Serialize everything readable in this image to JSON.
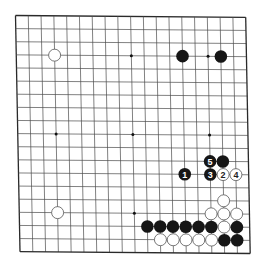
{
  "board": {
    "size": 19,
    "corners": {
      "top_left": [
        15.5,
        15.5
      ],
      "top_right": [
        245.7,
        17.3
      ],
      "bottom_left": [
        20.0,
        251.7
      ]
    },
    "line_color": "#4a4a4a",
    "edge_color": "#2a2a2a",
    "background": "#ffffff",
    "star_points": [
      [
        3,
        3
      ],
      [
        3,
        9
      ],
      [
        3,
        15
      ],
      [
        9,
        3
      ],
      [
        9,
        9
      ],
      [
        9,
        15
      ],
      [
        15,
        3
      ],
      [
        15,
        9
      ],
      [
        15,
        15
      ]
    ]
  },
  "colors": {
    "black_stone": "#161616",
    "white_stone": "#ffffff",
    "white_stone_outline": "#555555",
    "black_label": "#ffffff",
    "white_label": "#222222"
  },
  "stones": [
    {
      "row": 3,
      "col": 3,
      "color": "white",
      "label": ""
    },
    {
      "row": 3,
      "col": 13,
      "color": "black",
      "label": ""
    },
    {
      "row": 3,
      "col": 16,
      "color": "black",
      "label": ""
    },
    {
      "row": 11,
      "col": 15,
      "color": "black",
      "label": "5"
    },
    {
      "row": 11,
      "col": 16,
      "color": "black",
      "label": ""
    },
    {
      "row": 12,
      "col": 13,
      "color": "black",
      "label": "1"
    },
    {
      "row": 12,
      "col": 15,
      "color": "black",
      "label": "3"
    },
    {
      "row": 12,
      "col": 16,
      "color": "white",
      "label": "2"
    },
    {
      "row": 12,
      "col": 17,
      "color": "white",
      "label": "4"
    },
    {
      "row": 14,
      "col": 16,
      "color": "white",
      "label": ""
    },
    {
      "row": 15,
      "col": 3,
      "color": "white",
      "label": ""
    },
    {
      "row": 15,
      "col": 15,
      "color": "white",
      "label": ""
    },
    {
      "row": 15,
      "col": 16,
      "color": "white",
      "label": ""
    },
    {
      "row": 15,
      "col": 17,
      "color": "white",
      "label": ""
    },
    {
      "row": 16,
      "col": 10,
      "color": "black",
      "label": ""
    },
    {
      "row": 16,
      "col": 11,
      "color": "black",
      "label": ""
    },
    {
      "row": 16,
      "col": 12,
      "color": "black",
      "label": ""
    },
    {
      "row": 16,
      "col": 13,
      "color": "black",
      "label": ""
    },
    {
      "row": 16,
      "col": 14,
      "color": "black",
      "label": ""
    },
    {
      "row": 16,
      "col": 15,
      "color": "black",
      "label": ""
    },
    {
      "row": 16,
      "col": 16,
      "color": "white",
      "label": ""
    },
    {
      "row": 16,
      "col": 17,
      "color": "black",
      "label": ""
    },
    {
      "row": 17,
      "col": 11,
      "color": "white",
      "label": ""
    },
    {
      "row": 17,
      "col": 12,
      "color": "white",
      "label": ""
    },
    {
      "row": 17,
      "col": 13,
      "color": "white",
      "label": ""
    },
    {
      "row": 17,
      "col": 14,
      "color": "white",
      "label": ""
    },
    {
      "row": 17,
      "col": 15,
      "color": "white",
      "label": ""
    },
    {
      "row": 17,
      "col": 16,
      "color": "black",
      "label": ""
    },
    {
      "row": 17,
      "col": 17,
      "color": "black",
      "label": ""
    }
  ]
}
